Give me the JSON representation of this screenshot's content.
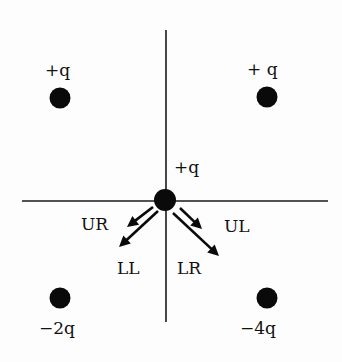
{
  "diagram": {
    "type": "point-charge-configuration",
    "axes": {
      "horizontal": "x-axis",
      "vertical": "y-axis"
    },
    "charges": [
      {
        "id": "top-left",
        "label": "+q"
      },
      {
        "id": "top-right",
        "label": "+ q"
      },
      {
        "id": "center",
        "label": "+q"
      },
      {
        "id": "bottom-left",
        "label": "−2q"
      },
      {
        "id": "bottom-right",
        "label": "−4q"
      }
    ],
    "force_arrows": [
      {
        "id": "UR",
        "label": "UR",
        "direction": "toward lower-left"
      },
      {
        "id": "LL",
        "label": "LL",
        "direction": "toward lower-left"
      },
      {
        "id": "UL",
        "label": "UL",
        "direction": "toward lower-right"
      },
      {
        "id": "LR",
        "label": "LR",
        "direction": "toward lower-right"
      }
    ],
    "colors": {
      "ink": "#0a0a0a",
      "background": "#fdfdfd"
    }
  }
}
